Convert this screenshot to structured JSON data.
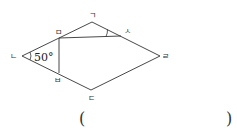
{
  "figure": {
    "type": "rhombus-with-fold",
    "vertices": {
      "giyeok": {
        "label": "ㄱ",
        "x": 92,
        "y": 22
      },
      "nieun": {
        "label": "ㄴ",
        "x": 22,
        "y": 56
      },
      "digeut": {
        "label": "ㄷ",
        "x": 91,
        "y": 90
      },
      "rieul": {
        "label": "ㄹ",
        "x": 160,
        "y": 56
      },
      "mieum": {
        "label": "ㅁ",
        "x": 59,
        "y": 38
      },
      "bieup": {
        "label": "ㅂ",
        "x": 59,
        "y": 73
      },
      "siot": {
        "label": "ㅅ",
        "x": 121,
        "y": 36
      }
    },
    "angle_label": "50°",
    "line_color": "#333333"
  },
  "answer": {
    "open_paren": "(",
    "close_paren": ")"
  }
}
